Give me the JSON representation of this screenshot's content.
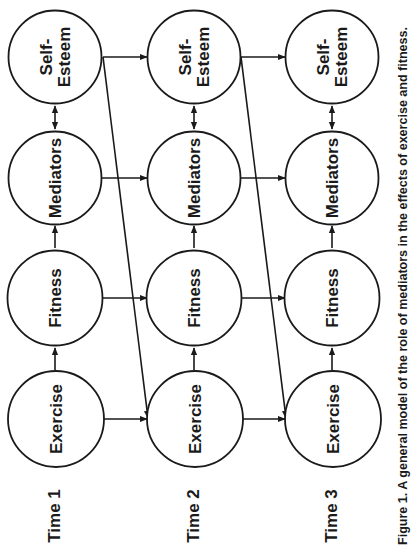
{
  "figure": {
    "caption": "Figure 1.  A general model of the role of mediators in the effects of exercise and fitness.",
    "orientation": "rotated -90 degrees (landscape figure on portrait page)"
  },
  "time_labels": [
    "Time 1",
    "Time 2",
    "Time 3"
  ],
  "constructs": [
    {
      "id": "exercise",
      "lines": [
        "Exercise"
      ]
    },
    {
      "id": "fitness",
      "lines": [
        "Fitness"
      ]
    },
    {
      "id": "mediators",
      "lines": [
        "Mediators"
      ]
    },
    {
      "id": "self_esteem",
      "lines": [
        "Self-",
        "Esteem"
      ]
    }
  ],
  "nodes": {
    "t1": {
      "exercise": "Exercise",
      "fitness": "Fitness",
      "mediators": "Mediators",
      "self_esteem_1": "Self-",
      "self_esteem_2": "Esteem"
    },
    "t2": {
      "exercise": "Exercise",
      "fitness": "Fitness",
      "mediators": "Mediators",
      "self_esteem_1": "Self-",
      "self_esteem_2": "Esteem"
    },
    "t3": {
      "exercise": "Exercise",
      "fitness": "Fitness",
      "mediators": "Mediators",
      "self_esteem_1": "Self-",
      "self_esteem_2": "Esteem"
    }
  },
  "edges": [
    {
      "from": "Exercise (Time 1)",
      "to": "Fitness (Time 1)",
      "type": "directed"
    },
    {
      "from": "Fitness (Time 1)",
      "to": "Mediators (Time 1)",
      "type": "directed"
    },
    {
      "from": "Mediators (Time 1)",
      "to": "Self-Esteem (Time 1)",
      "type": "bidirectional"
    },
    {
      "from": "Exercise (Time 2)",
      "to": "Fitness (Time 2)",
      "type": "directed"
    },
    {
      "from": "Fitness (Time 2)",
      "to": "Mediators (Time 2)",
      "type": "directed"
    },
    {
      "from": "Mediators (Time 2)",
      "to": "Self-Esteem (Time 2)",
      "type": "bidirectional"
    },
    {
      "from": "Exercise (Time 3)",
      "to": "Fitness (Time 3)",
      "type": "directed"
    },
    {
      "from": "Fitness (Time 3)",
      "to": "Mediators (Time 3)",
      "type": "directed"
    },
    {
      "from": "Mediators (Time 3)",
      "to": "Self-Esteem (Time 3)",
      "type": "bidirectional"
    },
    {
      "from": "Exercise (Time 1)",
      "to": "Exercise (Time 2)",
      "type": "directed"
    },
    {
      "from": "Fitness (Time 1)",
      "to": "Fitness (Time 2)",
      "type": "directed"
    },
    {
      "from": "Mediators (Time 1)",
      "to": "Mediators (Time 2)",
      "type": "directed"
    },
    {
      "from": "Self-Esteem (Time 1)",
      "to": "Self-Esteem (Time 2)",
      "type": "directed"
    },
    {
      "from": "Exercise (Time 2)",
      "to": "Exercise (Time 3)",
      "type": "directed"
    },
    {
      "from": "Fitness (Time 2)",
      "to": "Fitness (Time 3)",
      "type": "directed"
    },
    {
      "from": "Mediators (Time 2)",
      "to": "Mediators (Time 3)",
      "type": "directed"
    },
    {
      "from": "Self-Esteem (Time 2)",
      "to": "Self-Esteem (Time 3)",
      "type": "directed"
    },
    {
      "from": "Self-Esteem (Time 1)",
      "to": "Exercise (Time 2)",
      "type": "directed"
    },
    {
      "from": "Self-Esteem (Time 2)",
      "to": "Exercise (Time 3)",
      "type": "directed"
    }
  ],
  "colors": {
    "ink": "#1a1a1a",
    "background": "#ffffff"
  }
}
